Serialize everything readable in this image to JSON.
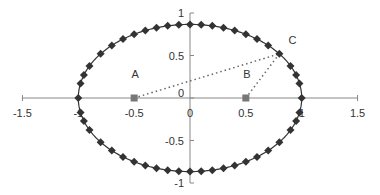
{
  "chart_data": {
    "type": "scatter",
    "title": "",
    "xlabel": "",
    "ylabel": "",
    "xlim": [
      -1.5,
      1.5
    ],
    "ylim": [
      -1,
      1
    ],
    "grid": false,
    "legend": null,
    "x_ticks": [
      {
        "value": -1.5,
        "label": "-1.5"
      },
      {
        "value": -1,
        "label": "-1"
      },
      {
        "value": -0.5,
        "label": "-0.5"
      },
      {
        "value": 0,
        "label": "0"
      },
      {
        "value": 0.5,
        "label": "0.5"
      },
      {
        "value": 1,
        "label": "1"
      },
      {
        "value": 1.5,
        "label": "1.5"
      }
    ],
    "y_ticks": [
      {
        "value": -1,
        "label": "-1"
      },
      {
        "value": -0.5,
        "label": "-0.5"
      },
      {
        "value": 0,
        "label": "0"
      },
      {
        "value": 0.5,
        "label": "0.5"
      },
      {
        "value": 1,
        "label": "1"
      }
    ],
    "series": [
      {
        "name": "ellipse",
        "style": "line-with-diamond-markers",
        "color": "#333333",
        "semi_axis_x": 1,
        "semi_axis_y": 0.866,
        "x": [
          -1,
          -0.98,
          -0.95,
          -0.9,
          -0.8,
          -0.7,
          -0.6,
          -0.5,
          -0.4,
          -0.3,
          -0.2,
          -0.1,
          0,
          0.1,
          0.2,
          0.3,
          0.4,
          0.5,
          0.6,
          0.7,
          0.8,
          0.9,
          0.95,
          0.98,
          1
        ],
        "y_upper": [
          0,
          0.172,
          0.27,
          0.377,
          0.52,
          0.618,
          0.693,
          0.75,
          0.794,
          0.826,
          0.849,
          0.862,
          0.866,
          0.862,
          0.849,
          0.826,
          0.794,
          0.75,
          0.693,
          0.618,
          0.52,
          0.377,
          0.27,
          0.172,
          0
        ],
        "y_lower": [
          0,
          -0.172,
          -0.27,
          -0.377,
          -0.52,
          -0.618,
          -0.693,
          -0.75,
          -0.794,
          -0.826,
          -0.849,
          -0.862,
          -0.866,
          -0.862,
          -0.849,
          -0.826,
          -0.794,
          -0.75,
          -0.693,
          -0.618,
          -0.52,
          -0.377,
          -0.27,
          -0.172,
          0
        ]
      },
      {
        "name": "foci",
        "style": "square-markers",
        "color": "#777777",
        "points": [
          {
            "label": "A",
            "x": -0.5,
            "y": 0
          },
          {
            "label": "B",
            "x": 0.5,
            "y": 0
          }
        ]
      },
      {
        "name": "point-on-ellipse",
        "style": "label-only",
        "points": [
          {
            "label": "C",
            "x": 0.8,
            "y": 0.52
          }
        ]
      },
      {
        "name": "focal-distances",
        "style": "dotted-lines",
        "color": "#666666",
        "segments": [
          {
            "from": "A",
            "to": "C",
            "x": [
              -0.5,
              0.8
            ],
            "y": [
              0,
              0.52
            ]
          },
          {
            "from": "B",
            "to": "C",
            "x": [
              0.5,
              0.8
            ],
            "y": [
              0,
              0.52
            ]
          }
        ]
      }
    ],
    "annotations": [
      "A",
      "B",
      "C"
    ]
  },
  "layout": {
    "origin_px": [
      190,
      98
    ],
    "x_scale_px": 111.7,
    "y_scale_px": 85,
    "axis_color": "#888888",
    "label_color": "#333333"
  }
}
